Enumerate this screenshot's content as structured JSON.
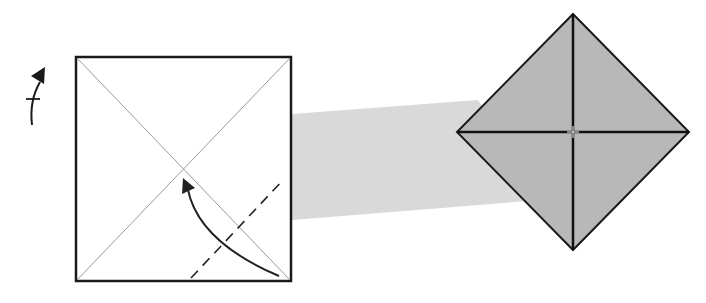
{
  "diagram": {
    "type": "origami-fold-step",
    "colors": {
      "background": "#ffffff",
      "paper_front": "#ffffff",
      "paper_back": "#b5b5b5",
      "transition_band": "#d8d8d8",
      "outline": "#1a1a1a",
      "crease": "#9a9a9a",
      "arrow": "#222222"
    },
    "elements": [
      {
        "name": "turn-over-symbol",
        "description": "Curved arrow with crossbar indicating flip the paper over"
      },
      {
        "name": "square-paper",
        "description": "White square with both diagonal creases"
      },
      {
        "name": "valley-fold-line",
        "description": "Dashed line near the bottom-right corner"
      },
      {
        "name": "fold-arrow",
        "description": "Curved arrow from bottom-right corner to the center"
      },
      {
        "name": "transition-band",
        "description": "Gray band linking the step to its result"
      },
      {
        "name": "result-diamond",
        "description": "Gray diamond with all corners folded to the center"
      }
    ]
  }
}
